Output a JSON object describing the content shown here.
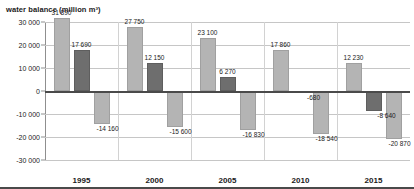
{
  "chart_data": {
    "type": "bar",
    "title": "water balance (million m³)",
    "xlabel": "",
    "ylabel": "",
    "ylim": [
      -30000,
      30000
    ],
    "yticks": [
      "30 000",
      "20 000",
      "10 000",
      "0",
      "-10 000",
      "-20 000",
      "-30 000"
    ],
    "ytick_values": [
      30000,
      20000,
      10000,
      0,
      -10000,
      -20000,
      -30000
    ],
    "grid": true,
    "legend": "none",
    "categories": [
      "1995",
      "2000",
      "2005",
      "2010",
      "2015"
    ],
    "series": [
      {
        "name": "inflow",
        "color": "#b4b4b4",
        "values": [
          31890,
          27750,
          23100,
          17860,
          12230
        ],
        "labels": [
          "31 890",
          "27 750",
          "23 100",
          "17 860",
          "12 230"
        ]
      },
      {
        "name": "balance",
        "color": "#6e6e6e",
        "values": [
          17690,
          12150,
          6270,
          -680,
          -8640
        ],
        "labels": [
          "17 690",
          "12 150",
          "6 270",
          "-680",
          "-8 640"
        ]
      },
      {
        "name": "outflow",
        "color": "#b4b4b4",
        "values": [
          -14160,
          -15600,
          -16830,
          -18540,
          -20870
        ],
        "labels": [
          "-14 160",
          "-15 600",
          "-16 830",
          "-18 540",
          "-20 870"
        ]
      }
    ]
  }
}
